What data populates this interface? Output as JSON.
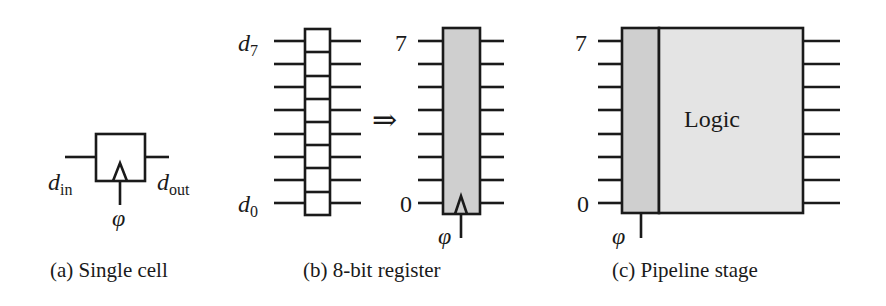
{
  "figure": {
    "panels": [
      {
        "id": "a",
        "caption": "(a) Single cell",
        "input_label": "d",
        "input_sub": "in",
        "output_label": "d",
        "output_sub": "out",
        "clock_label": "φ"
      },
      {
        "id": "b",
        "caption": "(b) 8-bit register",
        "top_label": "d",
        "top_sub": "7",
        "bottom_label": "d",
        "bottom_sub": "0",
        "arrow": "⇒",
        "reg_top": "7",
        "reg_bottom": "0",
        "clock_label": "φ",
        "bits": 8
      },
      {
        "id": "c",
        "caption": "(c) Pipeline stage",
        "top": "7",
        "bottom": "0",
        "logic_label": "Logic",
        "clock_label": "φ"
      }
    ],
    "colors": {
      "stroke": "#1a1a1a",
      "register_fill": "#cfcfcf",
      "logic_fill": "#e4e4e4"
    }
  }
}
